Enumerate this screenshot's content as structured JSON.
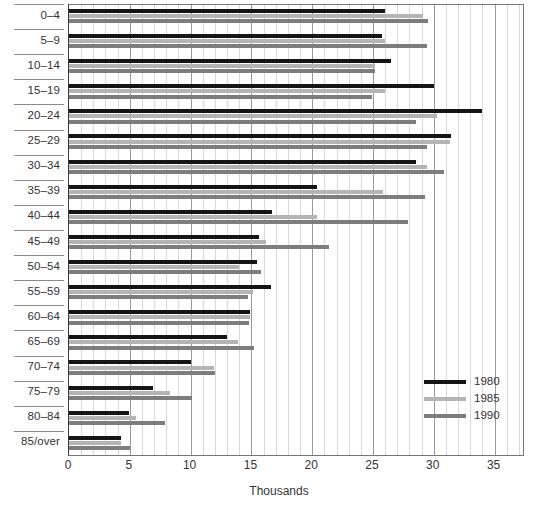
{
  "chart_data": {
    "type": "bar",
    "orientation": "horizontal",
    "title": "",
    "xlabel": "Thousands",
    "ylabel": "",
    "xlim": [
      0,
      37.5
    ],
    "xticks": [
      0,
      5,
      10,
      15,
      20,
      25,
      30,
      35
    ],
    "xtick_labels": [
      "0",
      "5",
      "10",
      "15",
      "20",
      "25",
      "30",
      "35"
    ],
    "grid": "vertical",
    "minor_gridlines": true,
    "legend_position": "inner-right",
    "categories": [
      "0–4",
      "5–9",
      "10–14",
      "15–19",
      "20–24",
      "25–29",
      "30–34",
      "35–39",
      "40–44",
      "45–49",
      "50–54",
      "55–59",
      "60–64",
      "65–69",
      "70–74",
      "75–79",
      "80–84",
      "85/over"
    ],
    "series": [
      {
        "name": "1980",
        "color": "#151515",
        "values": [
          26.0,
          25.7,
          26.5,
          30.0,
          34.0,
          31.4,
          28.5,
          20.4,
          16.7,
          15.6,
          15.5,
          16.6,
          14.9,
          13.0,
          10.0,
          6.9,
          4.9,
          4.3
        ]
      },
      {
        "name": "1985",
        "color": "#b4b4b4",
        "values": [
          29.1,
          26.0,
          25.2,
          26.0,
          30.3,
          31.3,
          29.4,
          25.8,
          20.4,
          16.2,
          14.0,
          15.1,
          14.9,
          13.9,
          11.9,
          8.3,
          5.5,
          4.3
        ]
      },
      {
        "name": "1990",
        "color": "#7d7d7d",
        "values": [
          29.5,
          29.4,
          25.2,
          24.9,
          28.5,
          29.4,
          30.8,
          29.3,
          27.9,
          21.4,
          15.8,
          14.7,
          14.8,
          15.2,
          12.0,
          10.1,
          7.9,
          5.0
        ]
      }
    ]
  },
  "legend": {
    "items": [
      {
        "label": "1980",
        "class": "y1980"
      },
      {
        "label": "1985",
        "class": "y1985"
      },
      {
        "label": "1990",
        "class": "y1990"
      }
    ]
  }
}
